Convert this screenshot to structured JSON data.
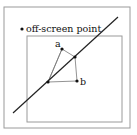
{
  "diagram": {
    "title": "",
    "labels": {
      "offscreen": "off-screen point",
      "a": "a",
      "b": "b"
    },
    "colors": {
      "background": "#ffffff",
      "frame": "#9a9a9a",
      "line": "#222222",
      "triangle": "#777777",
      "point": "#111111"
    },
    "frames": {
      "outer": {
        "x": 4,
        "y": 7,
        "w": 126,
        "h": 121
      },
      "inner": {
        "x": 27,
        "y": 36,
        "w": 95,
        "h": 86
      }
    },
    "clip_line": {
      "x1": 13,
      "y1": 113,
      "x2": 118,
      "y2": 17
    },
    "points": {
      "offscreen": {
        "x": 22,
        "y": 29
      },
      "a": {
        "x": 62,
        "y": 49
      },
      "b": {
        "x": 77,
        "y": 81
      },
      "intersect_upper": {
        "x": 75,
        "y": 57
      },
      "intersect_lower": {
        "x": 48,
        "y": 82
      }
    }
  }
}
